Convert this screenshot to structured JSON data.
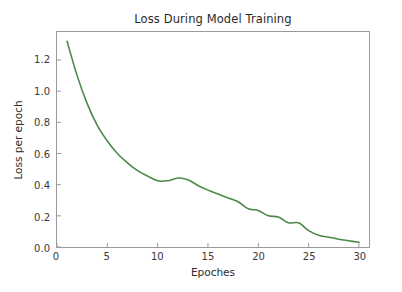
{
  "chart_data": {
    "type": "line",
    "title": "Loss During Model Training",
    "xlabel": "Epoches",
    "ylabel": "Loss per epoch",
    "xlim": [
      0,
      31
    ],
    "ylim": [
      0.0,
      1.38
    ],
    "grid": false,
    "legend": null,
    "line_color": "#4a8a47",
    "line_width": 1.6,
    "x": [
      1,
      2,
      3,
      4,
      5,
      6,
      7,
      8,
      9,
      10,
      11,
      12,
      13,
      14,
      15,
      16,
      17,
      18,
      19,
      20,
      21,
      22,
      23,
      24,
      25,
      26,
      27,
      28,
      29,
      30
    ],
    "series": [
      {
        "name": "Loss per epoch",
        "values": [
          1.32,
          1.1,
          0.92,
          0.78,
          0.68,
          0.6,
          0.54,
          0.49,
          0.455,
          0.425,
          0.425,
          0.443,
          0.432,
          0.395,
          0.365,
          0.34,
          0.315,
          0.29,
          0.245,
          0.235,
          0.2,
          0.193,
          0.155,
          0.155,
          0.105,
          0.075,
          0.062,
          0.05,
          0.04,
          0.03
        ]
      }
    ],
    "xticks": [
      {
        "value": 0,
        "label": "0"
      },
      {
        "value": 5,
        "label": "5"
      },
      {
        "value": 10,
        "label": "10"
      },
      {
        "value": 15,
        "label": "15"
      },
      {
        "value": 20,
        "label": "20"
      },
      {
        "value": 25,
        "label": "25"
      },
      {
        "value": 30,
        "label": "30"
      }
    ],
    "yticks": [
      {
        "value": 0.0,
        "label": "0.0"
      },
      {
        "value": 0.2,
        "label": "0.2"
      },
      {
        "value": 0.4,
        "label": "0.4"
      },
      {
        "value": 0.6,
        "label": "0.6"
      },
      {
        "value": 0.8,
        "label": "0.8"
      },
      {
        "value": 1.0,
        "label": "1.0"
      },
      {
        "value": 1.2,
        "label": "1.2"
      }
    ]
  },
  "figure": {
    "background_color": "#ffffff",
    "axes_color": "#9a9a9a",
    "text_color": "#2b2b2b"
  }
}
